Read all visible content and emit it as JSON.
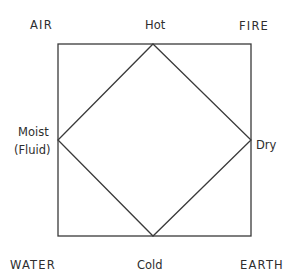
{
  "diagram": {
    "colors": {
      "line": "#3a3a3a",
      "text": "#2e2e2e",
      "background": "#ffffff"
    },
    "square": {
      "x": 58,
      "y": 44,
      "width": 193,
      "height": 192
    },
    "diamond": {
      "top": [
        153,
        44
      ],
      "right": [
        251,
        140
      ],
      "bottom": [
        153,
        236
      ],
      "left": [
        58,
        140
      ]
    },
    "elements": {
      "top_left": "AIR",
      "top_right": "FIRE",
      "bottom_left": "WATER",
      "bottom_right": "EARTH"
    },
    "qualities": {
      "top": "Hot",
      "right": "Dry",
      "bottom": "Cold",
      "left_line1": "Moist",
      "left_line2": "(Fluid)"
    }
  }
}
